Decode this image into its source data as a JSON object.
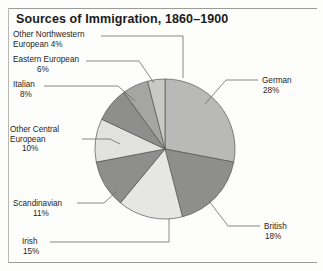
{
  "figure": {
    "title": "Sources of Immigration, 1860–1900",
    "width": 323,
    "height": 271
  },
  "chart_data": {
    "type": "pie",
    "title": "Sources of Immigration, 1860–1900",
    "xlabel": "",
    "ylabel": "",
    "unit": "percent",
    "legend_position": "callout-labels",
    "grid": false,
    "start_angle_deg": -90,
    "direction": "clockwise",
    "center": {
      "x": 165,
      "y": 149
    },
    "radius": 70,
    "categories": [
      "German",
      "British",
      "Irish",
      "Scandinavian",
      "Other Central European",
      "Italian",
      "Eastern European",
      "Other Northwestern European"
    ],
    "values": [
      28,
      18,
      15,
      11,
      10,
      8,
      6,
      4
    ],
    "colors": [
      "#b9b9b7",
      "#8e8e8c",
      "#e6e6e3",
      "#8e8e8c",
      "#e2e2df",
      "#8e8e8c",
      "#a5a5a2",
      "#c8c8c5"
    ],
    "slices": [
      {
        "label": "German",
        "value": 28,
        "value_text": "28%",
        "color": "#b9b9b7"
      },
      {
        "label": "British",
        "value": 18,
        "value_text": "18%",
        "color": "#8e8e8c"
      },
      {
        "label": "Irish",
        "value": 15,
        "value_text": "15%",
        "color": "#e6e6e3"
      },
      {
        "label": "Scandinavian",
        "value": 11,
        "value_text": "11%",
        "color": "#8e8e8c"
      },
      {
        "label": "Other Central European",
        "value": 10,
        "value_text": "10%",
        "color": "#e2e2df"
      },
      {
        "label": "Italian",
        "value": 8,
        "value_text": "8%",
        "color": "#8e8e8c"
      },
      {
        "label": "Eastern European",
        "value": 6,
        "value_text": "6%",
        "color": "#a5a5a2"
      },
      {
        "label": "Other Northwestern European",
        "value": 4,
        "value_text": "4%",
        "color": "#c8c8c5"
      }
    ]
  },
  "labels": {
    "german": {
      "name": "German",
      "line1": "German",
      "pct": "28%"
    },
    "british": {
      "name": "British",
      "line1": "British",
      "pct": "18%"
    },
    "irish": {
      "name": "Irish",
      "line1": "Irish",
      "pct": "15%"
    },
    "scandinavian": {
      "name": "Scandinavian",
      "line1": "Scandinavian",
      "pct": "11%"
    },
    "other_central_european": {
      "name": "Other Central European",
      "line1": "Other Central",
      "line2": "European",
      "pct": "10%"
    },
    "italian": {
      "name": "Italian",
      "line1": "Italian",
      "pct": "8%"
    },
    "eastern_european": {
      "name": "Eastern European",
      "line1": "Eastern European",
      "pct": "6%"
    },
    "other_northwestern_european": {
      "name": "Other Northwestern European",
      "line1": "Other Northwestern",
      "line2": "European",
      "pct": "4%"
    }
  },
  "colors": {
    "frame_rule": "#9a9a96",
    "text": "#1d1d1d",
    "title": "#1b1b1b",
    "slice_outline": "#55554f",
    "leader_line": "#6a6a66",
    "background": "#fdfdfc"
  }
}
